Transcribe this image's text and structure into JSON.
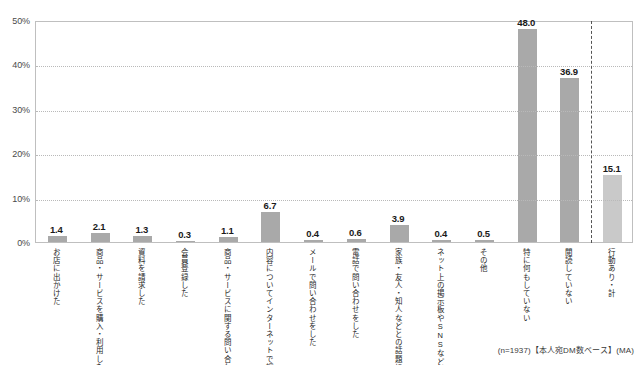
{
  "chart_data": {
    "type": "bar",
    "title": "",
    "subtitle": "",
    "xlabel": "",
    "ylabel": "",
    "ylim": [
      0,
      50
    ],
    "ytick_labels": [
      "0%",
      "10%",
      "20%",
      "30%",
      "40%",
      "50%"
    ],
    "ytick_values": [
      0,
      10,
      20,
      30,
      40,
      50
    ],
    "grid": true,
    "legend": "none",
    "categories": [
      "お店に出かけた",
      "商品・サービスを購入・利用した",
      "資料を請求した",
      "会員登録した",
      "商品・サービスに関する問い合わせをした",
      "内容についてインターネットで調べた",
      "メールで問い合わせをした",
      "電話で問い合わせをした",
      "家族・友人・知人などとの話題にした",
      "ネット上の掲示板やSNSなどに書き込んだ（FacebookやTwitterなど）",
      "その他",
      "特に何もしていない",
      "閲読していない",
      "行動あり・計"
    ],
    "values": [
      1.4,
      2.1,
      1.3,
      0.3,
      1.1,
      6.7,
      0.4,
      0.6,
      3.9,
      0.4,
      0.5,
      48.0,
      36.9,
      15.1
    ],
    "value_labels": [
      "1.4",
      "2.1",
      "1.3",
      "0.3",
      "1.1",
      "6.7",
      "0.4",
      "0.6",
      "3.9",
      "0.4",
      "0.5",
      "48.0",
      "36.9",
      "15.1"
    ],
    "bar_styles": [
      "dark",
      "dark",
      "dark",
      "dark",
      "dark",
      "dark",
      "dark",
      "dark",
      "dark",
      "dark",
      "dark",
      "dark",
      "dark",
      "light"
    ],
    "divider_after_index": 12,
    "colors": {
      "bar_dark": "#a9a9a9",
      "bar_light": "#c9c9c9",
      "grid": "#b9b9b9",
      "axis": "#bfbfbf",
      "text": "#231f20",
      "divider": "#555555"
    }
  },
  "footnote": "(n=1937)【本人宛DM数ベース】(MA)"
}
